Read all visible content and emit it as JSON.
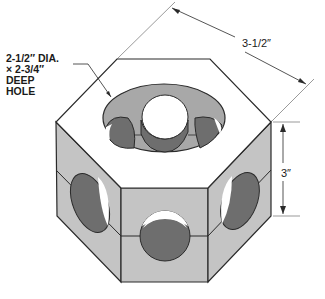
{
  "diagram": {
    "callout": {
      "lines": [
        "2-1/2″ DIA.",
        "× 2-3/4″",
        "DEEP",
        "HOLE"
      ]
    },
    "dimensions": {
      "width": "3-1/2″",
      "height": "3″"
    },
    "colors": {
      "face_light": "#c4c4c4",
      "face_top": "#ffffff",
      "hole_dark": "#6e6e6e",
      "bore_mid": "#a8a8a8",
      "outline": "#2a2a2a"
    }
  }
}
